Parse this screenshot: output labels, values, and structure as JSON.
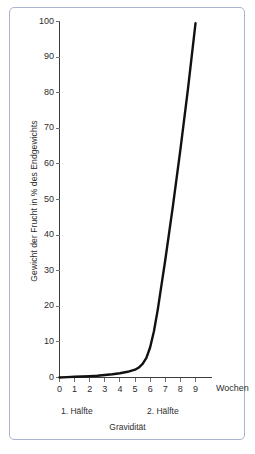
{
  "figure": {
    "frame_color": "#a9b4cf",
    "background": "#ffffff",
    "curve_color": "#111111",
    "axis_color": "#3b3b3b"
  },
  "chart_data": {
    "type": "line",
    "title": "",
    "subtitle": "",
    "xlabel": "Gravidität",
    "x_unit_label": "Wochen",
    "ylabel": "Gewicht der Frucht in % des Endgewichts",
    "xlim": [
      0,
      9
    ],
    "ylim": [
      0,
      100
    ],
    "grid": false,
    "legend": null,
    "x_ticks": [
      0,
      1,
      2,
      3,
      4,
      5,
      6,
      7,
      8,
      9
    ],
    "x_tick_labels": [
      "0",
      "1",
      "2",
      "3",
      "4",
      "5",
      "6",
      "7",
      "8",
      "9"
    ],
    "y_ticks": [
      0,
      10,
      20,
      30,
      40,
      50,
      60,
      70,
      80,
      90,
      100
    ],
    "y_tick_labels": [
      "0",
      "10",
      "20",
      "30",
      "40",
      "50",
      "60",
      "70",
      "80",
      "90",
      "100"
    ],
    "series": [
      {
        "name": "Gewicht der Frucht",
        "x": [
          0.0,
          0.5,
          1.0,
          1.5,
          2.0,
          2.5,
          3.0,
          3.5,
          4.0,
          4.5,
          5.0,
          5.25,
          5.5,
          5.75,
          6.0,
          6.25,
          6.5,
          6.75,
          7.0,
          7.5,
          8.0,
          8.5,
          9.0
        ],
        "values": [
          0.0,
          0.1,
          0.2,
          0.3,
          0.4,
          0.5,
          0.7,
          0.9,
          1.2,
          1.6,
          2.2,
          2.8,
          3.8,
          5.5,
          8.5,
          13.0,
          19.0,
          26.0,
          33.0,
          48.0,
          64.0,
          81.0,
          99.5
        ]
      }
    ],
    "annotations": [
      {
        "name": "first-half",
        "text": "1. Hälfte"
      },
      {
        "name": "second-half",
        "text": "2. Hälfte"
      }
    ]
  }
}
